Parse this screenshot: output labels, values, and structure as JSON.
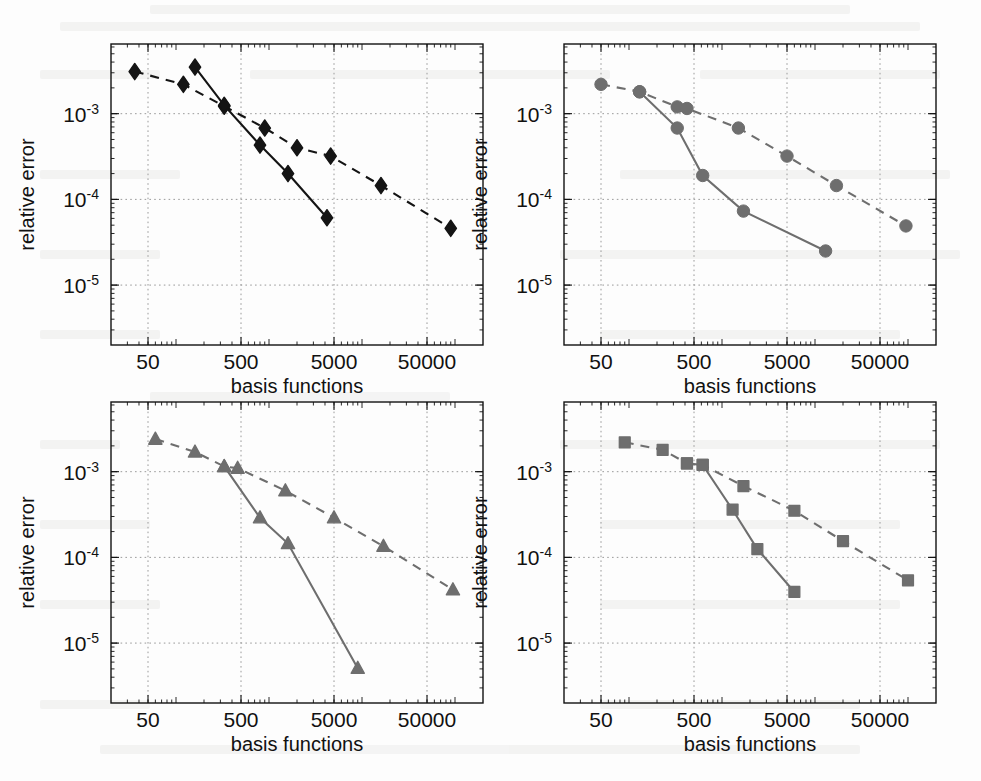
{
  "figure": {
    "background": "#fdfdfd",
    "panel_count": 4,
    "axis_color": "#111111",
    "grid_color": "#9a9a9a"
  },
  "axes_common": {
    "xlabel": "basis functions",
    "ylabel": "relative error",
    "xticks": [
      50,
      500,
      5000,
      50000
    ],
    "xtick_labels": [
      "50",
      "500",
      "5000",
      "50000"
    ],
    "yticks": [
      0.001,
      0.0001,
      1e-05
    ],
    "ytick_labels": [
      "10",
      "10",
      "10"
    ],
    "ytick_exponents": [
      "-3",
      "-4",
      "-5"
    ],
    "xlim": [
      20,
      200000
    ],
    "ylim": [
      2e-06,
      0.0065
    ],
    "xscale": "log",
    "yscale": "log",
    "grid": "on (dotted, major only)",
    "legend": "none"
  },
  "chart_data": [
    {
      "id": "panel-top-left",
      "type": "line",
      "position": "top-left",
      "title": "",
      "xlabel": "basis functions",
      "ylabel": "relative error",
      "xscale": "log",
      "yscale": "log",
      "xlim": [
        20,
        200000
      ],
      "ylim": [
        2e-06,
        0.0065
      ],
      "grid": true,
      "marker": "diamond",
      "color": "#141414",
      "series": [
        {
          "name": "dashed",
          "linestyle": "dashed",
          "marker": "diamond",
          "color": "#141414",
          "x": [
            36,
            120,
            330,
            900,
            2000,
            4600,
            16000,
            90000
          ],
          "y": [
            0.0031,
            0.0022,
            0.00122,
            0.00068,
            0.0004,
            0.00032,
            0.000145,
            4.6e-05
          ]
        },
        {
          "name": "solid",
          "linestyle": "solid",
          "marker": "diamond",
          "color": "#141414",
          "x": [
            160,
            330,
            800,
            1600,
            4200
          ],
          "y": [
            0.0035,
            0.00125,
            0.00043,
            0.0002,
            6.1e-05
          ]
        }
      ]
    },
    {
      "id": "panel-top-right",
      "type": "line",
      "position": "top-right",
      "title": "",
      "xlabel": "basis functions",
      "ylabel": "relative error",
      "xscale": "log",
      "yscale": "log",
      "xlim": [
        20,
        200000
      ],
      "ylim": [
        2e-06,
        0.0065
      ],
      "grid": true,
      "marker": "circle",
      "color": "#6e6e6e",
      "series": [
        {
          "name": "dashed",
          "linestyle": "dashed",
          "marker": "circle",
          "color": "#6e6e6e",
          "x": [
            50,
            130,
            330,
            420,
            1500,
            5000,
            17000,
            95000
          ],
          "y": [
            0.0022,
            0.0018,
            0.0012,
            0.00115,
            0.00068,
            0.00032,
            0.000145,
            4.9e-05
          ]
        },
        {
          "name": "solid",
          "linestyle": "solid",
          "marker": "circle",
          "color": "#6e6e6e",
          "x": [
            130,
            330,
            620,
            1700,
            13000
          ],
          "y": [
            0.0018,
            0.00068,
            0.00019,
            7.3e-05,
            2.5e-05
          ]
        }
      ]
    },
    {
      "id": "panel-bottom-left",
      "type": "line",
      "position": "bottom-left",
      "title": "",
      "xlabel": "basis functions",
      "ylabel": "relative error",
      "xscale": "log",
      "yscale": "log",
      "xlim": [
        20,
        200000
      ],
      "ylim": [
        2e-06,
        0.0065
      ],
      "grid": true,
      "marker": "triangle",
      "color": "#6e6e6e",
      "series": [
        {
          "name": "dashed",
          "linestyle": "dashed",
          "marker": "triangle",
          "color": "#6e6e6e",
          "x": [
            60,
            160,
            330,
            460,
            1500,
            5000,
            17000,
            95000
          ],
          "y": [
            0.0024,
            0.0017,
            0.00115,
            0.0011,
            0.0006,
            0.00029,
            0.000135,
            4.2e-05
          ]
        },
        {
          "name": "solid",
          "linestyle": "solid",
          "marker": "triangle",
          "color": "#6e6e6e",
          "x": [
            330,
            800,
            1600,
            9000
          ],
          "y": [
            0.00115,
            0.00029,
            0.000145,
            5.1e-06
          ]
        }
      ]
    },
    {
      "id": "panel-bottom-right",
      "type": "line",
      "position": "bottom-right",
      "title": "",
      "xlabel": "basis functions",
      "ylabel": "relative error",
      "xscale": "log",
      "yscale": "log",
      "xlim": [
        20,
        200000
      ],
      "ylim": [
        2e-06,
        0.0065
      ],
      "grid": true,
      "marker": "square",
      "color": "#6e6e6e",
      "series": [
        {
          "name": "dashed",
          "linestyle": "dashed",
          "marker": "square",
          "color": "#6e6e6e",
          "x": [
            90,
            230,
            420,
            620,
            1700,
            6000,
            20000,
            100000
          ],
          "y": [
            0.0022,
            0.0018,
            0.00125,
            0.0012,
            0.00068,
            0.00035,
            0.000155,
            5.4e-05
          ]
        },
        {
          "name": "solid",
          "linestyle": "solid",
          "marker": "square",
          "color": "#6e6e6e",
          "x": [
            420,
            620,
            1300,
            2400,
            6000
          ],
          "y": [
            0.00125,
            0.0012,
            0.00036,
            0.000125,
            3.95e-05
          ]
        }
      ]
    }
  ]
}
